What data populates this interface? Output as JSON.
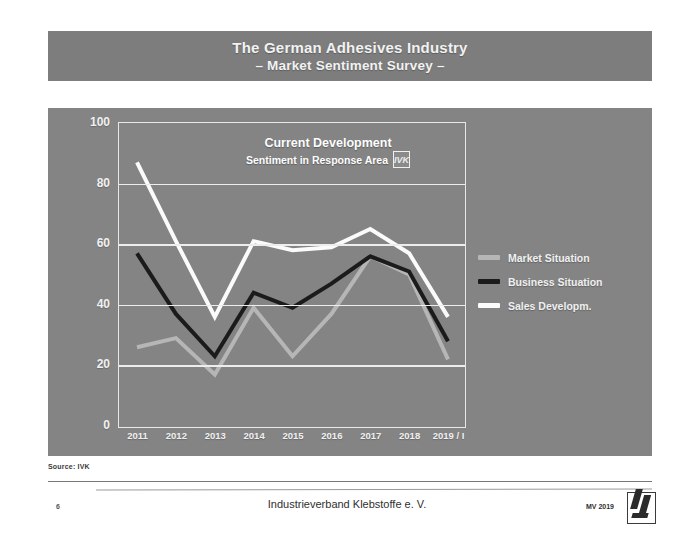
{
  "slide": {
    "title_line1": "The German Adhesives Industry",
    "title_line2": "– Market Sentiment Survey –",
    "source": "Source: IVK"
  },
  "chart_inner": {
    "title": "Current Development",
    "subtitle": "Sentiment in Response Area",
    "badge": "IVK"
  },
  "legend": {
    "items": [
      {
        "label": "Market Situation",
        "color": "#b6b6b6"
      },
      {
        "label": "Business Situation",
        "color": "#1b1b1b"
      },
      {
        "label": "Sales Developm.",
        "color": "#fbfbfb"
      }
    ]
  },
  "footer": {
    "page": "6",
    "center": "Industrieverband Klebstoffe e. V.",
    "right": "MV 2019",
    "logo": "ivk-logo-icon"
  },
  "colors": {
    "panel_bg": "#848484",
    "banner_bg": "#7d7d7d",
    "grid": "#ededed",
    "market": "#b6b6b6",
    "business": "#1b1b1b",
    "sales": "#fbfbfb"
  },
  "chart_data": {
    "type": "line",
    "title": "Current Development",
    "subtitle": "Sentiment in Response Area",
    "xlabel": "",
    "ylabel": "",
    "ylim": [
      0,
      100
    ],
    "yticks": [
      0,
      20,
      40,
      60,
      80,
      100
    ],
    "grid": true,
    "legend_position": "right",
    "categories": [
      "2011",
      "2012",
      "2013",
      "2014",
      "2015",
      "2016",
      "2017",
      "2018",
      "2019 / I"
    ],
    "series": [
      {
        "name": "Market Situation",
        "color": "#b6b6b6",
        "values": [
          26,
          29,
          17,
          39,
          23,
          37,
          56,
          50,
          22
        ]
      },
      {
        "name": "Business Situation",
        "color": "#1b1b1b",
        "values": [
          57,
          37,
          23,
          44,
          39,
          47,
          56,
          51,
          28
        ]
      },
      {
        "name": "Sales Developm.",
        "color": "#fbfbfb",
        "values": [
          87,
          61,
          36,
          61,
          58,
          59,
          65,
          57,
          36
        ]
      }
    ]
  }
}
